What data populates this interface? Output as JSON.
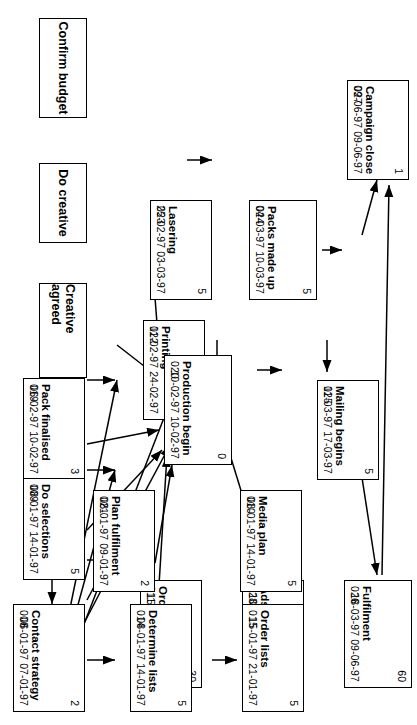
{
  "diagram": {
    "type": "pert-network",
    "orientation": "rotated-90",
    "line_color": "#000000",
    "box_fill": "#ffffff",
    "tasks": [
      {
        "key": "t027",
        "id": "027",
        "name": "Campaign close",
        "duration": "1",
        "start": "09-06-97",
        "finish": "09-06-97"
      },
      {
        "key": "t026",
        "id": "026",
        "name": "Fulfilment",
        "duration": "60",
        "start": "18-03-97",
        "finish": "09-06-97"
      },
      {
        "key": "t025",
        "id": "025",
        "name": "Mailing begins",
        "duration": "5",
        "start": "11-03-97",
        "finish": "17-03-97"
      },
      {
        "key": "t024",
        "id": "024",
        "name": "Packs made up",
        "duration": "5",
        "start": "04-03-97",
        "finish": "10-03-97"
      },
      {
        "key": "t028",
        "id": "028",
        "name": "Ads appear",
        "duration": "0",
        "start": "10-03-97",
        "finish": "10-03-97"
      },
      {
        "key": "t023",
        "id": "023",
        "name": "Lasering",
        "duration": "5",
        "start": "25-02-97",
        "finish": "03-03-97"
      },
      {
        "key": "t022",
        "id": "022",
        "name": "Printing",
        "duration": "10",
        "start": "11-02-97",
        "finish": "24-02-97"
      },
      {
        "key": "t011",
        "id": "011",
        "name": "Order media",
        "duration": "30",
        "start": "15-01-97",
        "finish": "25-02-97"
      },
      {
        "key": "t019",
        "id": "019",
        "name": "Pack finalised",
        "duration": "3",
        "start": "06-02-97",
        "finish": "10-02-97"
      },
      {
        "key": "t020",
        "id": "020",
        "name": "Production begin",
        "duration": "0",
        "start": "10-02-97",
        "finish": "10-02-97"
      },
      {
        "key": "t009",
        "id": "009",
        "name": "Do selections",
        "duration": "5",
        "start": "08-01-97",
        "finish": "14-01-97"
      },
      {
        "key": "t021",
        "id": "021",
        "name": "Plan fulfilment",
        "duration": "2",
        "start": "08-01-97",
        "finish": "09-01-97"
      },
      {
        "key": "t010",
        "id": "010",
        "name": "Media plan",
        "duration": "5",
        "start": "08-01-97",
        "finish": "14-01-97"
      },
      {
        "key": "t008",
        "id": "008",
        "name": "Contact strategy",
        "duration": "2",
        "start": "06-01-97",
        "finish": "07-01-97"
      },
      {
        "key": "t014",
        "id": "014",
        "name": "Determine lists",
        "duration": "5",
        "start": "08-01-97",
        "finish": "14-01-97"
      },
      {
        "key": "t015",
        "id": "015",
        "name": "Order lists",
        "duration": "5",
        "start": "15-01-97",
        "finish": "21-01-97"
      }
    ],
    "milestones": [
      {
        "key": "m_creative_agreed",
        "label": "Creative agreed"
      },
      {
        "key": "m_do_creative",
        "label": "Do creative"
      },
      {
        "key": "m_confirm_budget",
        "label": "Confirm budget"
      }
    ]
  }
}
